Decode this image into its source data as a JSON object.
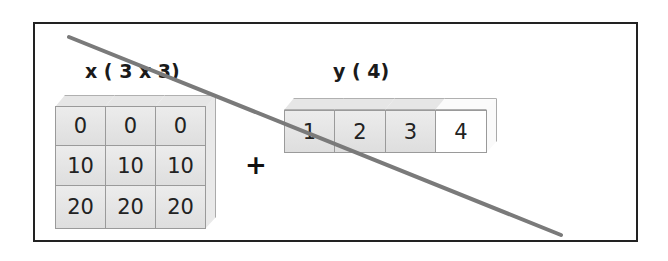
{
  "diagram": {
    "x_array": {
      "title": "x ( 3 x 3)",
      "rows": [
        [
          "0",
          "0",
          "0"
        ],
        [
          "10",
          "10",
          "10"
        ],
        [
          "20",
          "20",
          "20"
        ]
      ]
    },
    "operator": "+",
    "y_array": {
      "title": "y ( 4)",
      "cells": [
        "1",
        "2",
        "3",
        "4"
      ],
      "highlight_last_cell": "white"
    },
    "strike_line": {
      "from": [
        69,
        37
      ],
      "to": [
        561,
        235
      ],
      "color": "#7a7a7a",
      "meaning": "broadcast invalid"
    },
    "colors": {
      "cell_fill": "#e2e2e2",
      "cell_border": "#9a9a9a",
      "frame": "#222222"
    }
  }
}
